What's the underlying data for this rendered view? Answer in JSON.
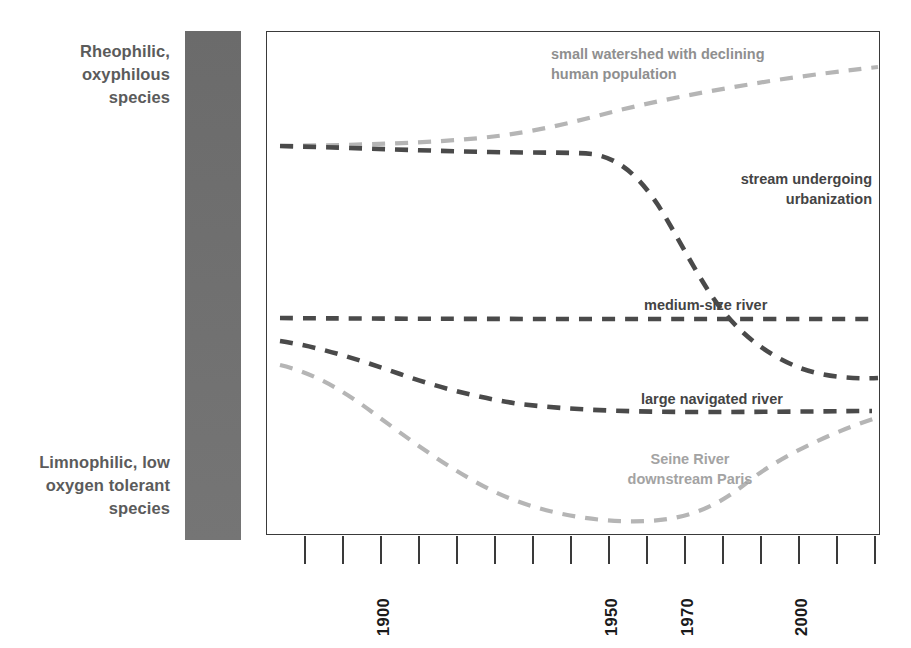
{
  "chart_data": {
    "type": "line",
    "title": "",
    "subtitle": "",
    "xlabel": "",
    "ylabel": "",
    "xlim": [
      1860,
      2020
    ],
    "ylim": [
      0,
      100
    ],
    "grid": false,
    "legend_position": "inline-annotations",
    "y_axis_category_labels": {
      "top": "Rheophilic,\noxyphilous\nspecies",
      "bottom": "Limnophilic,\nlow oxygen\ntolerant species"
    },
    "x_tick_years": [
      "1900",
      "1950",
      "1970",
      "2000"
    ],
    "x_tick_count": 17,
    "colors": {
      "dark_line": "#4a4a4a",
      "light_line": "#b5b5b5",
      "frame": "#3a3a3a",
      "gradient_bar_top": "#6b6b6b",
      "gradient_bar_bottom": "#757575",
      "label_text": "#5b5b5b",
      "annot_dark": "#444444",
      "annot_light": "#9e9e9e"
    },
    "series": [
      {
        "name": "small watershed with declining human population",
        "style": "dashed",
        "color": "#b5b5b5",
        "points": [
          [
            1864,
            77
          ],
          [
            1890,
            77
          ],
          [
            1910,
            78
          ],
          [
            1925,
            80
          ],
          [
            1940,
            83
          ],
          [
            1955,
            86
          ],
          [
            1970,
            88
          ],
          [
            1985,
            90
          ],
          [
            2000,
            92
          ],
          [
            2012,
            94
          ]
        ]
      },
      {
        "name": "stream undergoing urbanization",
        "style": "dashed",
        "color": "#4a4a4a",
        "points": [
          [
            1864,
            77
          ],
          [
            1900,
            76
          ],
          [
            1925,
            75
          ],
          [
            1940,
            75
          ],
          [
            1950,
            73
          ],
          [
            1960,
            67
          ],
          [
            1970,
            58
          ],
          [
            1980,
            45
          ],
          [
            1990,
            35
          ],
          [
            2000,
            29
          ],
          [
            2012,
            26
          ]
        ]
      },
      {
        "name": "medium-size river",
        "style": "dashed",
        "color": "#4a4a4a",
        "points": [
          [
            1864,
            43
          ],
          [
            1920,
            43
          ],
          [
            1970,
            43
          ],
          [
            2012,
            43
          ]
        ]
      },
      {
        "name": "large navigated river",
        "style": "dashed",
        "color": "#4a4a4a",
        "points": [
          [
            1864,
            39
          ],
          [
            1890,
            36
          ],
          [
            1910,
            32
          ],
          [
            1930,
            28
          ],
          [
            1950,
            25
          ],
          [
            1970,
            25
          ],
          [
            1990,
            25
          ],
          [
            2012,
            25
          ]
        ]
      },
      {
        "name": "Seine River downstream Paris",
        "style": "dashed",
        "color": "#b5b5b5",
        "points": [
          [
            1864,
            34
          ],
          [
            1885,
            30
          ],
          [
            1905,
            22
          ],
          [
            1925,
            14
          ],
          [
            1945,
            8
          ],
          [
            1960,
            5
          ],
          [
            1970,
            4
          ],
          [
            1985,
            8
          ],
          [
            2000,
            16
          ],
          [
            2012,
            22
          ]
        ]
      }
    ],
    "annotations": [
      {
        "text": "small watershed with declining\nhuman population",
        "color": "#8f8f8f"
      },
      {
        "text": "stream undergoing\nurbanization",
        "color": "#444444"
      },
      {
        "text": "medium-size river",
        "color": "#444444"
      },
      {
        "text": "large navigated river",
        "color": "#444444"
      },
      {
        "text": "Seine River\ndownstream Paris",
        "color": "#a3a3a3"
      }
    ]
  },
  "axis": {
    "top_label": "Rheophilic,\noxyphilous\nspecies",
    "bottom_label": "Limnophilic,\nlow oxygen\ntolerant species"
  },
  "annotations": {
    "watershed": "small watershed with declining\nhuman population",
    "urbanization": "stream undergoing\nurbanization",
    "medium_river": "medium-size river",
    "large_river": "large navigated river",
    "seine": "Seine River\ndownstream Paris"
  },
  "xaxis": {
    "years": [
      {
        "label": "1900",
        "x": 380
      },
      {
        "label": "1950",
        "x": 608
      },
      {
        "label": "1970",
        "x": 684
      },
      {
        "label": "2000",
        "x": 798
      }
    ],
    "tick_x_positions": [
      304,
      342,
      380,
      418,
      456,
      494,
      532,
      570,
      608,
      646,
      684,
      722,
      760,
      798,
      836,
      874
    ]
  }
}
